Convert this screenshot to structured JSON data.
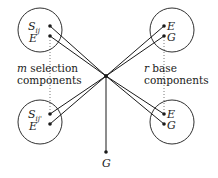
{
  "diagram": {
    "hub": {
      "x": 106,
      "y": 76
    },
    "root": {
      "label": "G",
      "x": 106,
      "y": 152
    },
    "groups": {
      "selection": {
        "var": "m",
        "line1": " selection",
        "line2": "components"
      },
      "base": {
        "var": "r",
        "line1": " base",
        "line2": "components"
      }
    },
    "components": [
      {
        "id": "top-left",
        "kind": "selection",
        "cx": 40,
        "cy": 30,
        "top_label": "S",
        "top_sub": "ij",
        "bottom_label": "E"
      },
      {
        "id": "bottom-left",
        "kind": "selection",
        "cx": 40,
        "cy": 122,
        "top_label": "S",
        "top_sub": "ij'",
        "bottom_label": "E"
      },
      {
        "id": "top-right",
        "kind": "base",
        "cx": 172,
        "cy": 30,
        "top_label": "E",
        "bottom_label": "G"
      },
      {
        "id": "bottom-right",
        "kind": "base",
        "cx": 172,
        "cy": 122,
        "top_label": "E",
        "bottom_label": "G"
      }
    ],
    "colors": {
      "stroke": "#1a1a1a",
      "dotted": "#555555"
    }
  }
}
